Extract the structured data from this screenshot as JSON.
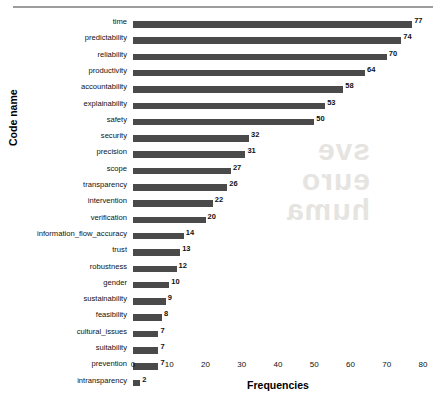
{
  "chart_data": {
    "type": "bar",
    "orientation": "horizontal",
    "title": "",
    "xlabel": "Frequencies",
    "ylabel": "Code name",
    "xlim": [
      0,
      80
    ],
    "xticks": [
      0,
      10,
      20,
      30,
      40,
      50,
      60,
      70,
      80
    ],
    "grid": false,
    "legend": null,
    "bar_color": "#4a4a4a",
    "value_labels": true,
    "categories": [
      "time",
      "predictability",
      "reliability",
      "productivity",
      "accountability",
      "explainability",
      "safety",
      "security",
      "precision",
      "scope",
      "transparency",
      "intervention",
      "verification",
      "information_flow_accuracy",
      "trust",
      "robustness",
      "gender",
      "sustainability",
      "feasibility",
      "cultural_issues",
      "suitability",
      "prevention",
      "intransparency"
    ],
    "values": [
      77,
      74,
      70,
      64,
      58,
      53,
      50,
      32,
      31,
      27,
      26,
      22,
      20,
      14,
      13,
      12,
      10,
      9,
      8,
      7,
      7,
      7,
      2
    ]
  },
  "watermark": {
    "line1": "sve",
    "line2": "euro",
    "line3": "huma"
  }
}
